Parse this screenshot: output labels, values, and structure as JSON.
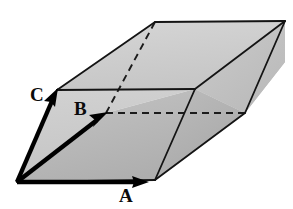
{
  "figure": {
    "kind": "parallelepiped-vector-diagram",
    "background_color": "#ffffff",
    "outline_color": "#121212",
    "hidden_edge_style": "dashed",
    "vector_color": "#000000",
    "canvas": {
      "width": 293,
      "height": 209
    }
  },
  "vectors": [
    {
      "id": "A",
      "label": "A",
      "data_name": "vector-a",
      "description": "base vector pointing right along the front bottom edge",
      "origin": {
        "x": 17,
        "y": 182
      },
      "tip": {
        "x": 147,
        "y": 182
      },
      "label_position": {
        "x": 119,
        "y": 186
      },
      "color": "#000000",
      "shaft_width": 4.2,
      "arrowhead": "solid-triangle"
    },
    {
      "id": "B",
      "label": "B",
      "data_name": "vector-b",
      "description": "vector pointing up and to the right into the depth direction",
      "origin": {
        "x": 17,
        "y": 182
      },
      "tip": {
        "x": 106,
        "y": 113
      },
      "label_position": {
        "x": 74,
        "y": 99
      },
      "color": "#000000",
      "shaft_width": 4.2,
      "arrowhead": "solid-triangle"
    },
    {
      "id": "C",
      "label": "C",
      "data_name": "vector-c",
      "description": "steep vector pointing up and slightly right along the left slanted edge",
      "origin": {
        "x": 17,
        "y": 182
      },
      "tip": {
        "x": 57,
        "y": 90
      },
      "label_position": {
        "x": 30,
        "y": 85
      },
      "color": "#000000",
      "shaft_width": 4.2,
      "arrowhead": "solid-triangle"
    }
  ],
  "vertices": {
    "origin": {
      "x": 17,
      "y": 182,
      "name": "origin",
      "visible": true
    },
    "a": {
      "x": 155,
      "y": 180,
      "name": "a-corner",
      "visible": true
    },
    "b": {
      "x": 106,
      "y": 113,
      "name": "b-corner",
      "visible": false
    },
    "c": {
      "x": 57,
      "y": 90,
      "name": "c-corner",
      "visible": true
    },
    "ab": {
      "x": 245,
      "y": 113,
      "name": "a-plus-b-corner",
      "visible": true
    },
    "ac": {
      "x": 195,
      "y": 89,
      "name": "a-plus-c-corner",
      "visible": true
    },
    "bc": {
      "x": 155,
      "y": 22,
      "name": "b-plus-c-corner",
      "visible": true
    },
    "abc": {
      "x": 285,
      "y": 21,
      "name": "a-plus-b-plus-c-corner",
      "visible": true
    }
  },
  "faces": [
    {
      "name": "top-face",
      "data_name": "face-top",
      "polygon": "57,90 155,22 285,21 195,89",
      "fill": "#cdcdcd",
      "visible": true
    },
    {
      "name": "left-face",
      "data_name": "face-left",
      "polygon": "17,182 57,90 195,89 155,180",
      "fill": "#c6c6c6",
      "visible": true
    },
    {
      "name": "right-face",
      "data_name": "face-right",
      "polygon": "195,89 285,21 285,90 245,113",
      "fill": "#c2c2c2",
      "visible": true
    },
    {
      "name": "front-face",
      "data_name": "face-front",
      "polygon": "155,180 195,89 245,113 245,113",
      "fill": "#b4b4b4",
      "visible": true
    }
  ],
  "edges": {
    "solid": [
      {
        "from": "c",
        "to": "bc",
        "name": "edge-c-to-bc"
      },
      {
        "from": "bc",
        "to": "abc",
        "name": "edge-bc-to-abc"
      },
      {
        "from": "abc",
        "to": "ac",
        "name": "edge-abc-to-ac"
      },
      {
        "from": "ac",
        "to": "c",
        "name": "edge-ac-to-c"
      },
      {
        "from": "origin",
        "to": "c",
        "name": "edge-origin-to-c"
      },
      {
        "from": "origin",
        "to": "a",
        "name": "edge-origin-to-a"
      },
      {
        "from": "a",
        "to": "ac",
        "name": "edge-a-to-ac"
      },
      {
        "from": "a",
        "to": "ab",
        "name": "edge-a-to-ab"
      },
      {
        "from": "ab",
        "to": "abc",
        "name": "edge-ab-to-abc"
      }
    ],
    "dashed": [
      {
        "from": "b",
        "to": "bc",
        "name": "hidden-edge-b-to-bc"
      },
      {
        "from": "b",
        "to": "ab",
        "name": "hidden-edge-b-to-ab"
      }
    ]
  },
  "labels": {
    "a": "A",
    "b": "B",
    "c": "C"
  }
}
